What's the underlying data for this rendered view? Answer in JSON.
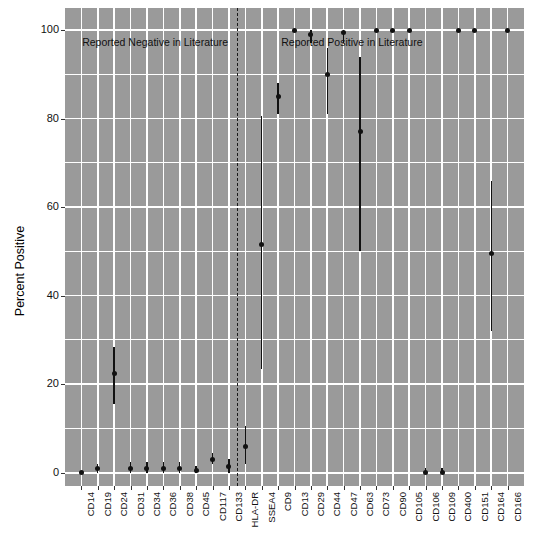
{
  "chart_data": {
    "type": "scatter",
    "title": "",
    "xlabel": "",
    "ylabel": "Percent Positive",
    "ylim": [
      -3,
      105
    ],
    "yticks": [
      0,
      20,
      40,
      60,
      80,
      100
    ],
    "grid": true,
    "legend": null,
    "annotations": [
      {
        "text": "Reported Negative in Literature",
        "x_index": 4.5,
        "y": 97
      },
      {
        "text": "Reported Positive in Literature",
        "x_index": 16.5,
        "y": 97
      }
    ],
    "divider_after_index": 10,
    "categories": [
      "CD14",
      "CD19",
      "CD24",
      "CD31",
      "CD34",
      "CD36",
      "CD38",
      "CD45",
      "CD117",
      "CD133",
      "HLA-DR",
      "SSEA4",
      "CD9",
      "CD13",
      "CD29",
      "CD44",
      "CD47",
      "CD63",
      "CD73",
      "CD90",
      "CD105",
      "CD106",
      "CD109",
      "CD400",
      "CD151",
      "CD164",
      "CD166"
    ],
    "values": [
      0,
      1,
      22.5,
      1,
      1,
      1,
      1,
      0.5,
      3,
      1.5,
      6,
      51.5,
      85,
      100,
      99,
      90,
      99.5,
      77,
      100,
      100,
      100,
      0,
      0,
      100,
      100,
      49.5,
      100
    ],
    "lower": [
      0,
      0,
      15.5,
      0,
      0,
      0,
      0,
      0,
      2,
      0,
      2,
      23.5,
      81,
      100,
      97,
      81,
      97,
      50,
      100,
      100,
      100,
      0,
      0,
      100,
      100,
      32,
      100
    ],
    "upper": [
      0,
      2,
      28.5,
      2.5,
      2.5,
      2.5,
      2.5,
      1.5,
      4.5,
      3,
      10.5,
      80.5,
      88,
      100,
      100,
      96,
      100,
      94,
      100,
      100,
      100,
      1,
      1,
      100,
      100,
      66,
      100
    ]
  },
  "axis": {
    "y_title": "Percent Positive"
  }
}
